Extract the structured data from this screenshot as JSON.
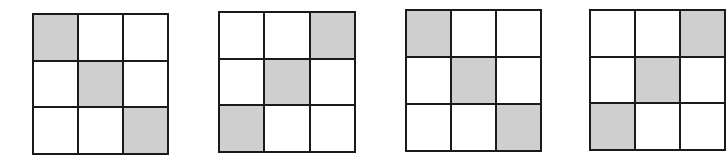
{
  "figure": {
    "type": "grid-pattern-sequence",
    "shade_color": "#cfcfcf",
    "line_color": "#1a1a1a",
    "grids": [
      {
        "label": "grid-1",
        "x": 32,
        "y": 13,
        "w": 137,
        "h": 142,
        "shaded": [
          [
            0,
            0
          ],
          [
            1,
            1
          ],
          [
            2,
            2
          ]
        ]
      },
      {
        "label": "grid-2",
        "x": 218,
        "y": 11,
        "w": 138,
        "h": 142,
        "shaded": [
          [
            0,
            2
          ],
          [
            1,
            1
          ],
          [
            2,
            0
          ]
        ]
      },
      {
        "label": "grid-3",
        "x": 405,
        "y": 9,
        "w": 137,
        "h": 143,
        "shaded": [
          [
            0,
            0
          ],
          [
            1,
            1
          ],
          [
            2,
            2
          ]
        ]
      },
      {
        "label": "grid-4",
        "x": 589,
        "y": 9,
        "w": 137,
        "h": 142,
        "shaded": [
          [
            0,
            2
          ],
          [
            1,
            1
          ],
          [
            2,
            0
          ]
        ]
      }
    ]
  }
}
